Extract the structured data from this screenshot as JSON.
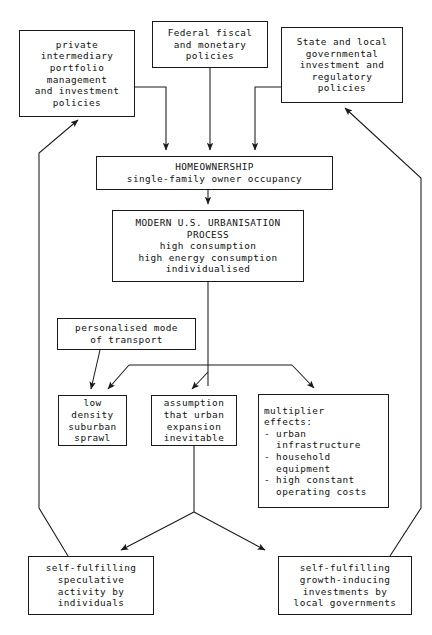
{
  "diagram": {
    "type": "flowchart",
    "background_color": "#ffffff",
    "line_color": "#1a1a1a",
    "text_color": "#111111",
    "nodes": [
      {
        "id": "private-intermediary",
        "lines": [
          "private",
          "intermediary",
          "portfolio",
          "management",
          "and investment",
          "policies"
        ],
        "align": "center",
        "x": 19,
        "y": 30,
        "w": 116,
        "h": 87
      },
      {
        "id": "federal-fiscal",
        "lines": [
          "Federal fiscal",
          "and monetary",
          "policies"
        ],
        "align": "center",
        "x": 152,
        "y": 21,
        "w": 116,
        "h": 47
      },
      {
        "id": "state-local",
        "lines": [
          "State and local",
          "governmental",
          "investment and",
          "regulatory",
          "policies"
        ],
        "align": "center",
        "x": 281,
        "y": 27,
        "w": 122,
        "h": 76
      },
      {
        "id": "homeownership",
        "lines": [
          "HOMEOWNERSHIP",
          "single-family owner occupancy"
        ],
        "align": "center",
        "x": 96,
        "y": 156,
        "w": 237,
        "h": 34
      },
      {
        "id": "urbanisation-process",
        "lines": [
          "MODERN U.S. URBANISATION",
          "PROCESS",
          "high consumption",
          "high energy consumption",
          "individualised"
        ],
        "align": "center",
        "x": 112,
        "y": 210,
        "w": 192,
        "h": 72
      },
      {
        "id": "personalised-transport",
        "lines": [
          "personalised mode",
          "of transport"
        ],
        "align": "center",
        "x": 57,
        "y": 318,
        "w": 139,
        "h": 32
      },
      {
        "id": "suburban-sprawl",
        "lines": [
          "low",
          "density",
          "suburban",
          "sprawl"
        ],
        "align": "center",
        "x": 58,
        "y": 395,
        "w": 69,
        "h": 51
      },
      {
        "id": "urban-expansion-assumption",
        "lines": [
          "assumption",
          "that urban",
          "expansion",
          "inevitable"
        ],
        "align": "center",
        "x": 151,
        "y": 395,
        "w": 86,
        "h": 51
      },
      {
        "id": "multiplier-effects",
        "lines": [
          "multiplier",
          "effects:",
          "- urban",
          "  infrastructure",
          "- household",
          "  equipment",
          "- high constant",
          "  operating costs"
        ],
        "align": "left",
        "x": 258,
        "y": 394,
        "w": 131,
        "h": 114
      },
      {
        "id": "speculative-activity",
        "lines": [
          "self-fulfilling",
          "speculative",
          "activity by",
          "individuals"
        ],
        "align": "center",
        "x": 28,
        "y": 556,
        "w": 126,
        "h": 59
      },
      {
        "id": "growth-inducing-investments",
        "lines": [
          "self-fulfilling",
          "growth-inducing",
          "investments by",
          "local governments"
        ],
        "align": "center",
        "x": 278,
        "y": 556,
        "w": 134,
        "h": 59
      }
    ],
    "edges": [
      {
        "id": "private-to-homeownership",
        "from": "private-intermediary",
        "to": "homeownership",
        "arrow": true
      },
      {
        "id": "federal-to-homeownership",
        "from": "federal-fiscal",
        "to": "homeownership",
        "arrow": true
      },
      {
        "id": "state-to-homeownership",
        "from": "state-local",
        "to": "homeownership",
        "arrow": true
      },
      {
        "id": "homeownership-to-urbanisation",
        "from": "homeownership",
        "to": "urbanisation-process",
        "arrow": true
      },
      {
        "id": "urbanisation-to-sprawl",
        "from": "urbanisation-process",
        "to": "suburban-sprawl",
        "arrow": true
      },
      {
        "id": "urbanisation-to-assumption",
        "from": "urbanisation-process",
        "to": "urban-expansion-assumption",
        "arrow": true
      },
      {
        "id": "urbanisation-to-multiplier",
        "from": "urbanisation-process",
        "to": "multiplier-effects",
        "arrow": true
      },
      {
        "id": "transport-to-sprawl",
        "from": "personalised-transport",
        "to": "suburban-sprawl",
        "arrow": true
      },
      {
        "id": "assumption-to-speculative",
        "from": "urban-expansion-assumption",
        "to": "speculative-activity",
        "arrow": true
      },
      {
        "id": "assumption-to-growth",
        "from": "urban-expansion-assumption",
        "to": "growth-inducing-investments",
        "arrow": true
      },
      {
        "id": "speculative-feedback-to-private",
        "from": "speculative-activity",
        "to": "private-intermediary",
        "arrow": true
      },
      {
        "id": "growth-feedback-to-state",
        "from": "growth-inducing-investments",
        "to": "state-local",
        "arrow": true
      }
    ]
  }
}
